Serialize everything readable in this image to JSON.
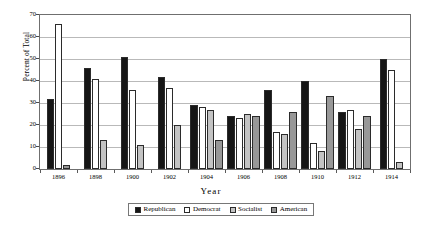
{
  "chart_data": {
    "type": "bar",
    "title": "",
    "xlabel": "Year",
    "ylabel": "Percent of Total",
    "categories": [
      "1896",
      "1898",
      "1900",
      "1902",
      "1904",
      "1906",
      "1908",
      "1910",
      "1912",
      "1914"
    ],
    "ylim": [
      0,
      70
    ],
    "yticks": [
      0,
      10,
      20,
      30,
      40,
      50,
      60,
      70
    ],
    "grid": true,
    "legend_position": "bottom",
    "series": [
      {
        "name": "Republican",
        "color": "#161616",
        "values": [
          32,
          46,
          51,
          42,
          29,
          24,
          36,
          40,
          26,
          50
        ]
      },
      {
        "name": "Democrat",
        "color": "#ffffff",
        "values": [
          66,
          41,
          36,
          37,
          28,
          23,
          17,
          12,
          27,
          45
        ]
      },
      {
        "name": "Socialist",
        "color": "#c3c3c3",
        "values": [
          null,
          13,
          11,
          20,
          27,
          25,
          16,
          8,
          18,
          3
        ]
      },
      {
        "name": "American",
        "color": "#989898",
        "values": [
          2,
          null,
          null,
          null,
          13,
          24,
          26,
          33,
          24,
          null
        ]
      }
    ]
  },
  "legend": {
    "items": [
      {
        "label": "Republican",
        "swatch": "legend-swatch-republican"
      },
      {
        "label": "Democrat",
        "swatch": "legend-swatch-democrat"
      },
      {
        "label": "Socialist",
        "swatch": "legend-swatch-socialist"
      },
      {
        "label": "American",
        "swatch": "legend-swatch-american"
      }
    ]
  }
}
